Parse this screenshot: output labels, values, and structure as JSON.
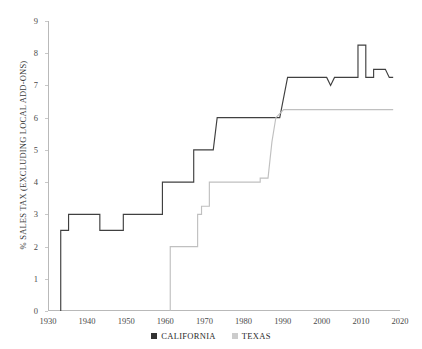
{
  "chart_data": {
    "type": "line",
    "title": "",
    "xlabel": "",
    "ylabel": "% SALES TAX (EXCLUDING LOCAL ADD-ONS)",
    "xlim": [
      1930,
      2020
    ],
    "ylim": [
      0,
      9
    ],
    "xticks": [
      1930,
      1940,
      1950,
      1960,
      1970,
      1980,
      1990,
      2000,
      2010,
      2020
    ],
    "yticks": [
      0,
      1,
      2,
      3,
      4,
      5,
      6,
      7,
      8,
      9
    ],
    "grid": false,
    "legend_position": "bottom-center",
    "series": [
      {
        "name": "CALIFORNIA",
        "color": "#404040",
        "step": "post",
        "points": [
          [
            1933,
            0.0
          ],
          [
            1933,
            2.5
          ],
          [
            1935,
            2.5
          ],
          [
            1935,
            3.0
          ],
          [
            1943,
            3.0
          ],
          [
            1943,
            2.5
          ],
          [
            1949,
            2.5
          ],
          [
            1949,
            3.0
          ],
          [
            1959,
            3.0
          ],
          [
            1959,
            4.0
          ],
          [
            1967,
            4.0
          ],
          [
            1967,
            5.0
          ],
          [
            1972,
            5.0
          ],
          [
            1973,
            6.0
          ],
          [
            1974,
            6.0
          ],
          [
            1981,
            6.0
          ],
          [
            1989,
            6.0
          ],
          [
            1991,
            7.25
          ],
          [
            2001,
            7.25
          ],
          [
            2002,
            7.0
          ],
          [
            2003,
            7.25
          ],
          [
            2009,
            7.25
          ],
          [
            2009,
            8.25
          ],
          [
            2011,
            8.25
          ],
          [
            2011,
            7.25
          ],
          [
            2013,
            7.25
          ],
          [
            2013,
            7.5
          ],
          [
            2016,
            7.5
          ],
          [
            2017,
            7.25
          ],
          [
            2018,
            7.25
          ]
        ]
      },
      {
        "name": "TEXAS",
        "color": "#c0c0c0",
        "step": "post",
        "points": [
          [
            1961,
            0.0
          ],
          [
            1961,
            2.0
          ],
          [
            1968,
            2.0
          ],
          [
            1968,
            3.0
          ],
          [
            1969,
            3.0
          ],
          [
            1969,
            3.25
          ],
          [
            1971,
            3.25
          ],
          [
            1971,
            4.0
          ],
          [
            1984,
            4.0
          ],
          [
            1984,
            4.125
          ],
          [
            1986,
            4.125
          ],
          [
            1987,
            5.25
          ],
          [
            1988,
            6.0
          ],
          [
            1990,
            6.25
          ],
          [
            2018,
            6.25
          ]
        ]
      }
    ]
  },
  "legend": {
    "items": [
      {
        "label": "CALIFORNIA",
        "color": "#333333"
      },
      {
        "label": "TEXAS",
        "color": "#cccccc"
      }
    ]
  }
}
